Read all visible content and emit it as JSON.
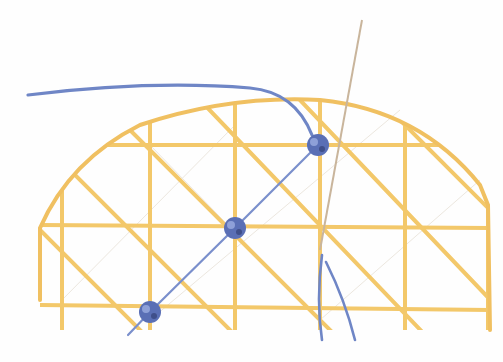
{
  "image": {
    "subject": "embroidery stitch: blue thread knots on yellow laid grid in a semicircle, with needle",
    "colors": {
      "background": "#fefefe",
      "grid_thread": "#f3c86a",
      "grid_thread_dark": "#e8b654",
      "blue_thread": "#6f86c6",
      "blue_knot": "#5a6fb5",
      "needle": "#c9b59c",
      "faint_guide": "#ece7df"
    },
    "grid": {
      "verticals_x": [
        62,
        150,
        235,
        320,
        405,
        488
      ],
      "horizontals_y": [
        145,
        225,
        305
      ]
    },
    "knots": [
      {
        "x": 318,
        "y": 145
      },
      {
        "x": 235,
        "y": 228
      },
      {
        "x": 150,
        "y": 312
      }
    ]
  }
}
